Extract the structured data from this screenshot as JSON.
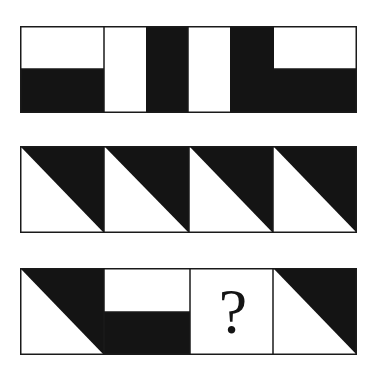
{
  "puzzle": {
    "colors": {
      "fill": "#141414",
      "background": "#ffffff",
      "stroke": "#1a1a1a"
    },
    "rows": [
      {
        "name": "row-1",
        "cells": [
          {
            "pattern": "white-top-half-black-bottom"
          },
          {
            "pattern": "white-left-half-black-right"
          },
          {
            "pattern": "white-left-half-black-right"
          },
          {
            "pattern": "black-left-half-white-top-right"
          }
        ]
      },
      {
        "name": "row-2",
        "cells": [
          {
            "pattern": "diagonal-black-upper-right"
          },
          {
            "pattern": "diagonal-black-upper-right"
          },
          {
            "pattern": "diagonal-black-upper-right"
          },
          {
            "pattern": "diagonal-black-upper-right"
          }
        ]
      },
      {
        "name": "row-3",
        "cells": [
          {
            "pattern": "diagonal-black-upper-right"
          },
          {
            "pattern": "white-top-half-black-bottom"
          },
          {
            "pattern": "unknown"
          },
          {
            "pattern": "diagonal-black-upper-right"
          }
        ]
      }
    ],
    "question_mark": "?"
  }
}
